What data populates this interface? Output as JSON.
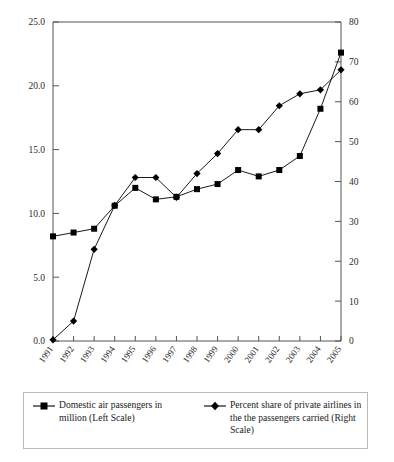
{
  "chart_data": {
    "type": "line",
    "title": "",
    "xlabel": "",
    "ylabel": "",
    "categories": [
      "1991",
      "1992",
      "1993",
      "1994",
      "1995",
      "1996",
      "1997",
      "1998",
      "1999",
      "2000",
      "2001",
      "2002",
      "2003",
      "2004",
      "2005"
    ],
    "grid": false,
    "legend_position": "bottom",
    "axes": {
      "left": {
        "label": "Domestic air passengers in million (Left Scale)",
        "min": 0.0,
        "max": 25.0,
        "step": 5.0,
        "ticks": [
          "0.0",
          "5.0",
          "10.0",
          "15.0",
          "20.0",
          "25.0"
        ],
        "tick_values": [
          0.0,
          5.0,
          10.0,
          15.0,
          20.0,
          25.0
        ]
      },
      "right": {
        "label": "Percent share of private airlines in the the passengers carried (Right Scale)",
        "min": 0,
        "max": 80,
        "step": 10,
        "ticks": [
          "0",
          "10",
          "20",
          "30",
          "40",
          "50",
          "60",
          "70",
          "80"
        ],
        "tick_values": [
          0,
          10,
          20,
          30,
          40,
          50,
          60,
          70,
          80
        ]
      }
    },
    "series": [
      {
        "name": "Domestic air passengers in million (Left Scale)",
        "axis": "left",
        "marker": "square",
        "color": "#000000",
        "values": [
          8.2,
          8.5,
          8.8,
          10.6,
          12.0,
          11.1,
          11.3,
          11.9,
          12.3,
          13.4,
          12.9,
          13.4,
          14.5,
          18.2,
          22.6
        ]
      },
      {
        "name": "Percent share of private airlines in the the passengers carried (Right Scale)",
        "axis": "right",
        "marker": "diamond",
        "color": "#000000",
        "values": [
          0.3,
          5.0,
          23.0,
          34.0,
          41.0,
          41.0,
          36.0,
          42.0,
          47.0,
          53.0,
          53.0,
          59.0,
          62.0,
          63.0,
          68.0
        ]
      }
    ]
  },
  "legend": {
    "entries": [
      {
        "label": "Domestic air passengers in million (Left Scale)",
        "marker": "square-line-marker"
      },
      {
        "label": "Percent share of private airlines in the the passengers carried (Right Scale)",
        "marker": "diamond-line-marker"
      }
    ]
  }
}
